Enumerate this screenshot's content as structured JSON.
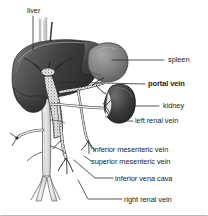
{
  "figure": {
    "background_color": "#ffffff",
    "width": 208,
    "height": 216
  },
  "labels": [
    {
      "id": "liver",
      "text": "liver",
      "bold": false,
      "text_x": 27,
      "text_y": 13,
      "anchor": "start",
      "leader": "M 33 16 L 33 50",
      "target": "liver-organ"
    },
    {
      "id": "spleen",
      "text": "spleen",
      "bold": false,
      "text_x": 168,
      "text_y": 62,
      "anchor": "start",
      "leader": "M 112 60 L 164 60",
      "target": "spleen-organ"
    },
    {
      "id": "portal-vein",
      "text": "portal vein",
      "bold": true,
      "text_x": 148,
      "text_y": 86,
      "anchor": "start",
      "leader": "M 58 82 L 145 84",
      "target": "portal-vein-vessel"
    },
    {
      "id": "kidney",
      "text": "kidney",
      "bold": false,
      "text_x": 163,
      "text_y": 108,
      "anchor": "start",
      "leader": "M 130 106 L 159 106",
      "target": "kidney-organ"
    },
    {
      "id": "left-renal-vein",
      "text": "left renal vein",
      "bold": false,
      "text_x": 135,
      "text_y": 123,
      "anchor": "start",
      "leader": "M 103 103 L 116 121 L 133 121",
      "target": "left-renal-vein-vessel"
    },
    {
      "id": "inferior-mesenteric-vein",
      "text": "inferior mesenteric vein",
      "bold": false,
      "text_x": 93,
      "text_y": 152,
      "anchor": "start",
      "leader": "M 88 140 L 92 149",
      "target": "inferior-mesenteric-vein-vessel"
    },
    {
      "id": "superior-mesenteric-vein",
      "text": "superior mesenteric vein",
      "bold": false,
      "text_x": 91,
      "text_y": 164,
      "anchor": "start",
      "leader": "M 84 156 L 91 161",
      "target": "superior-mesenteric-vein-vessel"
    },
    {
      "id": "inferior-vena-cava",
      "text": "inferior vena cava",
      "bold": false,
      "text_x": 115,
      "text_y": 181,
      "anchor": "start",
      "leader": "M 74 160 L 95 178 L 113 178",
      "target": "inferior-vena-cava-vessel"
    },
    {
      "id": "right-renal-vein",
      "text": "right renal vein",
      "bold": false,
      "text_x": 124,
      "text_y": 202,
      "anchor": "start",
      "leader": "M 78 180 L 88 199 L 122 199",
      "target": "right-renal-vein-vessel"
    }
  ],
  "organs": [
    {
      "id": "liver-organ",
      "name": "liver",
      "fill_dark": "#3c3c3c",
      "fill_light": "#8e8e8e"
    },
    {
      "id": "spleen-organ",
      "name": "spleen",
      "fill_dark": "#6d6d6d",
      "fill_light": "#9a9a9a"
    },
    {
      "id": "kidney-organ",
      "name": "kidney",
      "fill_dark": "#2e2e2e",
      "fill_light": "#757575"
    }
  ],
  "vessels": [
    {
      "id": "portal-vein-vessel",
      "name": "portal vein",
      "style": "stippled"
    },
    {
      "id": "splenic-vein-vessel",
      "name": "splenic vein",
      "style": "stippled"
    },
    {
      "id": "superior-mesenteric-vein-vessel",
      "name": "superior mesenteric vein",
      "style": "stippled"
    },
    {
      "id": "inferior-mesenteric-vein-vessel",
      "name": "inferior mesenteric vein",
      "style": "stippled"
    },
    {
      "id": "inferior-vena-cava-vessel",
      "name": "inferior vena cava",
      "style": "outline"
    },
    {
      "id": "left-renal-vein-vessel",
      "name": "left renal vein",
      "style": "outline"
    },
    {
      "id": "right-renal-vein-vessel",
      "name": "right renal vein",
      "style": "outline"
    },
    {
      "id": "hepatic-veins-vessel",
      "name": "hepatic veins",
      "style": "outline"
    }
  ]
}
